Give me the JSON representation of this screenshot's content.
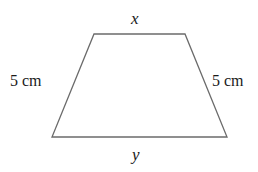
{
  "figure": {
    "name": "isosceles-trapezoid-diagram",
    "stroke_color": "#6b6b6b",
    "background_color": "#ffffff",
    "text_color": "#1a1a1a",
    "stroke_width": 1.3
  },
  "labels": {
    "top_side": "x",
    "bottom_side": "y",
    "left_side": "5 cm",
    "right_side": "5 cm"
  },
  "chart_data": {
    "type": "diagram",
    "shape": "trapezoid",
    "vertices": [
      {
        "name": "top-left",
        "x": 94,
        "y": 34
      },
      {
        "name": "top-right",
        "x": 185,
        "y": 34
      },
      {
        "name": "bottom-right",
        "x": 227,
        "y": 137
      },
      {
        "name": "bottom-left",
        "x": 52,
        "y": 137
      }
    ],
    "edges": [
      {
        "name": "top",
        "label": "x",
        "from": "top-left",
        "to": "top-right"
      },
      {
        "name": "right-leg",
        "label": "5 cm",
        "from": "top-right",
        "to": "bottom-right"
      },
      {
        "name": "bottom",
        "label": "y",
        "from": "bottom-right",
        "to": "bottom-left"
      },
      {
        "name": "left-leg",
        "label": "5 cm",
        "from": "bottom-left",
        "to": "top-left"
      }
    ]
  }
}
